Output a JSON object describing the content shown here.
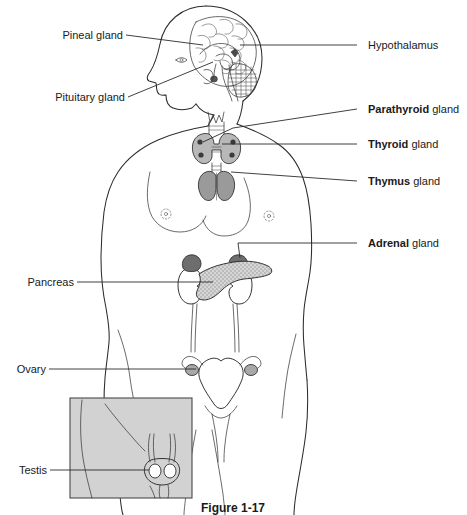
{
  "figure": {
    "caption": "Figure 1-17",
    "background_color": "#ffffff",
    "line_color": "#2b2b2b"
  },
  "labels": {
    "left": [
      {
        "id": "pineal",
        "text": "Pineal gland",
        "bold_word": "",
        "x": 56,
        "y": 39,
        "line_from_x": 126,
        "line_from_y": 35,
        "line_to_x": 203,
        "line_to_y": 45
      },
      {
        "id": "pituitary",
        "text": "Pituitary gland",
        "bold_word": "",
        "x": 50,
        "y": 101,
        "line_from_x": 128,
        "line_from_y": 97,
        "line_to_x": 213,
        "line_to_y": 62
      },
      {
        "id": "pancreas",
        "text": "Pancreas",
        "bold_word": "",
        "x": 22,
        "y": 286,
        "line_from_x": 77,
        "line_from_y": 282,
        "line_to_x": 213,
        "line_to_y": 282
      },
      {
        "id": "ovary",
        "text": "Ovary",
        "bold_word": "",
        "x": 14,
        "y": 373,
        "line_from_x": 49,
        "line_from_y": 369,
        "line_to_x": 196,
        "line_to_y": 369
      },
      {
        "id": "testis",
        "text": "Testis",
        "bold_word": "",
        "x": 14,
        "y": 474,
        "line_from_x": 50,
        "line_from_y": 470,
        "line_to_x": 146,
        "line_to_y": 470
      }
    ],
    "right": [
      {
        "id": "hypothalamus",
        "text": "Hypothalamus",
        "bold_word": "",
        "rest": "",
        "x": 368,
        "y": 49,
        "line_from_x": 357,
        "line_from_y": 45,
        "line_to_x": 240,
        "line_to_y": 45
      },
      {
        "id": "parathyroid",
        "text": "Parathyroid gland",
        "bold_word": "Parathyroid",
        "rest": " gland",
        "x": 368,
        "y": 113,
        "line_from_x": 357,
        "line_from_y": 109,
        "line_to_x": 233,
        "line_to_y": 128
      },
      {
        "id": "thyroid",
        "text": "Thyroid gland",
        "bold_word": "Thyroid",
        "rest": " gland",
        "x": 368,
        "y": 148,
        "line_from_x": 357,
        "line_from_y": 144,
        "line_to_x": 222,
        "line_to_y": 144
      },
      {
        "id": "thymus",
        "text": "Thymus gland",
        "bold_word": "Thymus",
        "rest": " gland",
        "x": 368,
        "y": 185,
        "line_from_x": 357,
        "line_from_y": 181,
        "line_to_x": 231,
        "line_to_y": 172
      },
      {
        "id": "adrenal",
        "text": "Adrenal gland",
        "bold_word": "Adrenal",
        "rest": " gland",
        "x": 368,
        "y": 247,
        "line_from_x": 357,
        "line_from_y": 243,
        "line_to_x": 238,
        "line_to_y": 243
      }
    ]
  },
  "organs": [
    {
      "id": "brain",
      "name": "brain",
      "fill": "#ffffff"
    },
    {
      "id": "pineal-body",
      "name": "pineal-gland",
      "fill": "#4a4a4a"
    },
    {
      "id": "pituitary-body",
      "name": "pituitary-gland",
      "fill": "#555555"
    },
    {
      "id": "thyroid-body",
      "name": "thyroid-gland",
      "fill": "#b8b8b8"
    },
    {
      "id": "thymus-body",
      "name": "thymus-gland",
      "fill": "#9a9a9a"
    },
    {
      "id": "adrenal-left",
      "name": "adrenal-gland-left",
      "fill": "#6e6e6e"
    },
    {
      "id": "adrenal-right",
      "name": "adrenal-gland-right",
      "fill": "#6e6e6e"
    },
    {
      "id": "pancreas-body",
      "name": "pancreas",
      "fill": "#c9c9c9"
    },
    {
      "id": "kidney-left",
      "name": "kidney-left",
      "fill": "#ffffff"
    },
    {
      "id": "kidney-right",
      "name": "kidney-right",
      "fill": "#ffffff"
    },
    {
      "id": "uterus",
      "name": "uterus",
      "fill": "#ffffff"
    },
    {
      "id": "ovary-left",
      "name": "ovary-left",
      "fill": "#a8a8a8"
    },
    {
      "id": "ovary-right",
      "name": "ovary-right",
      "fill": "#a8a8a8"
    },
    {
      "id": "testis-body",
      "name": "testis",
      "fill": "#ffffff"
    }
  ],
  "inset": {
    "name": "testis-inset-panel",
    "x": 70,
    "y": 398,
    "width": 122,
    "height": 100,
    "fill": "#d2d2d2",
    "border": "#4a4a4a"
  }
}
